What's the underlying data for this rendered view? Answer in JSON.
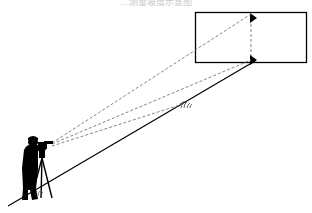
{
  "caption": "…测量坡度示意图",
  "diagram": {
    "elements": [
      {
        "name": "target-rectangle"
      },
      {
        "name": "vertical-dashed-line"
      },
      {
        "name": "top-arrow"
      },
      {
        "name": "bottom-arrow"
      },
      {
        "name": "slope-line"
      },
      {
        "name": "sight-line-top"
      },
      {
        "name": "sight-line-bottom"
      },
      {
        "name": "sight-line-ground"
      },
      {
        "name": "grass-tuft"
      },
      {
        "name": "surveyor-silhouette"
      },
      {
        "name": "theodolite-tripod"
      }
    ]
  }
}
